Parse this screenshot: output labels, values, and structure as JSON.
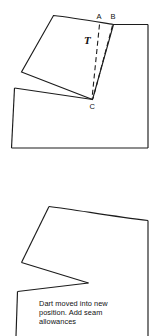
{
  "figure": {
    "background_color": "#ffffff",
    "line_color": "#1c1c1c",
    "width": 157,
    "height": 336
  },
  "upper_diagram": {
    "name": "pattern-with-pivoted-dart",
    "labels": {
      "point_a": "A",
      "point_b": "B",
      "point_c": "C",
      "pivot_marker": "T"
    },
    "description": "Bodice block with side panel rotated open about point C, dashed lines A-C and B-C show the original and new dart legs"
  },
  "lower_diagram": {
    "name": "pattern-with-dart-closed",
    "caption_lines": [
      "Dart moved into new",
      "position. Add seam",
      "allowances"
    ],
    "caption_full": "Dart moved into new position. Add seam allowances"
  }
}
